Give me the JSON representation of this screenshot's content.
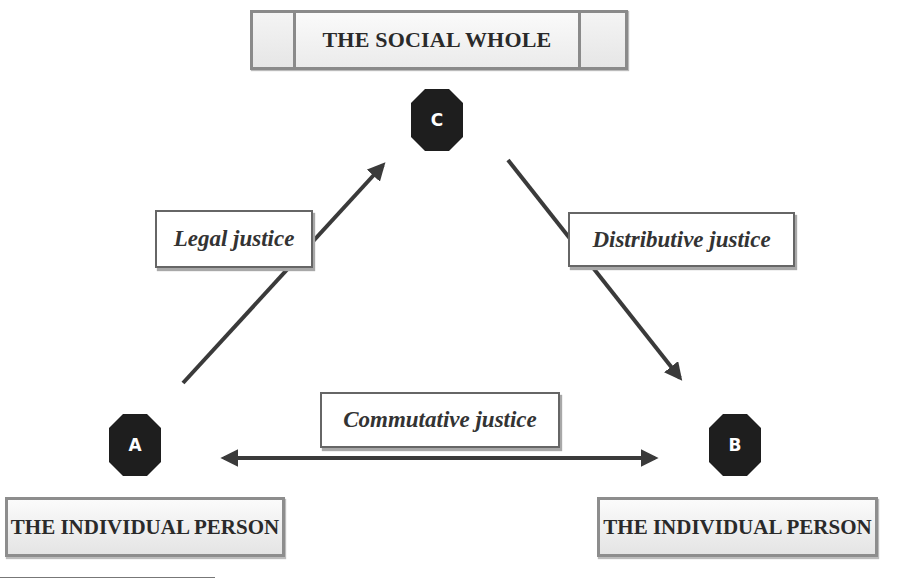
{
  "diagram": {
    "title": "THE SOCIAL WHOLE",
    "nodes": {
      "c": {
        "letter": "C",
        "role": "social whole"
      },
      "a": {
        "letter": "A",
        "label": "THE INDIVIDUAL PERSON"
      },
      "b": {
        "letter": "B",
        "label": "THE INDIVIDUAL PERSON"
      }
    },
    "relations": {
      "legal": {
        "label": "Legal justice",
        "from": "A",
        "to": "C"
      },
      "distributive": {
        "label": "Distributive justice",
        "from": "C",
        "to": "B"
      },
      "commutative": {
        "label": "Commutative justice",
        "from": "A",
        "to": "B",
        "bidirectional": true
      }
    },
    "colors": {
      "node_fill": "#1e1e1e",
      "arrow": "#3a3a3a",
      "box_border": "#8a8a8a",
      "label_border": "#666666"
    }
  }
}
